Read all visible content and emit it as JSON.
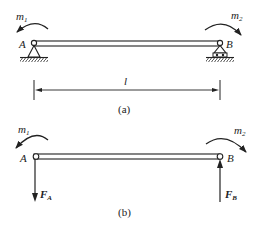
{
  "figure_a": {
    "caption": "(a)",
    "moment_left": {
      "symbol": "m",
      "sub": "1"
    },
    "moment_right": {
      "symbol": "m",
      "sub": "2"
    },
    "point_left": "A",
    "point_right": "B",
    "length_label": "l",
    "support_left": "pin-support",
    "support_right": "roller-support"
  },
  "figure_b": {
    "caption": "(b)",
    "moment_left": {
      "symbol": "m",
      "sub": "1"
    },
    "moment_right": {
      "symbol": "m",
      "sub": "2"
    },
    "point_left": "A",
    "point_right": "B",
    "force_left": {
      "symbol": "F",
      "sub": "A",
      "direction": "down"
    },
    "force_right": {
      "symbol": "F",
      "sub": "B",
      "direction": "up"
    }
  },
  "colors": {
    "stroke": "#222222",
    "background": "#ffffff"
  }
}
